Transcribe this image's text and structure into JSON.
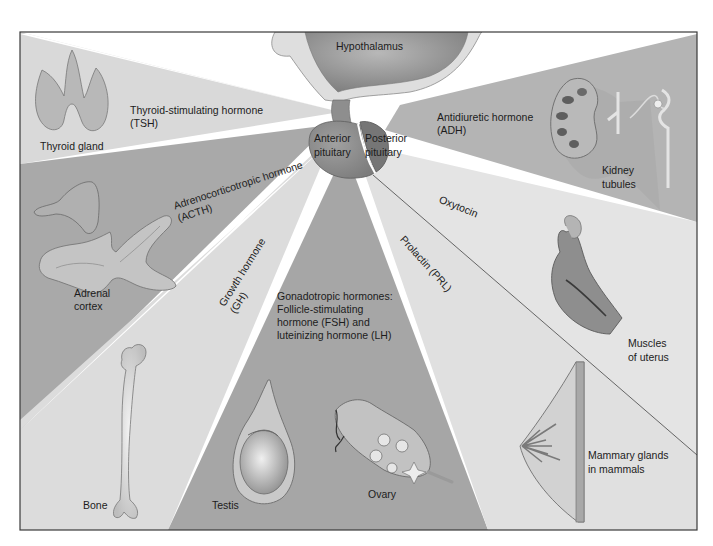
{
  "colors": {
    "background": "#ffffff",
    "frame": "#3a3a3a",
    "tsh_wedge": "#d9d9d9",
    "acth_wedge": "#a9a9a9",
    "gh_wedge": "#dddddd",
    "gonadotropic_wedge": "#a6a6a6",
    "prl_wedge": "#e0e0e0",
    "oxytocin_wedge": "#e3e3e3",
    "adh_wedge": "#b3b3b3",
    "hypothalamus": "#9a9a9a",
    "hypothalamus_rim": "#dcdcdc",
    "anterior_pituitary": "#8c8c8c",
    "posterior_pituitary": "#7a7a7a"
  },
  "brain": {
    "hypothalamus": "Hypothalamus",
    "anterior_pituitary": [
      "Anterior",
      "pituitary"
    ],
    "posterior_pituitary": [
      "Posterior",
      "pituitary"
    ]
  },
  "hormones": {
    "tsh": [
      "Thyroid-stimulating hormone",
      "(TSH)"
    ],
    "acth": [
      "Adrenocorticotropic hormone",
      "(ACTH)"
    ],
    "gh": [
      "Growth hormone",
      "(GH)"
    ],
    "gonadotropic": [
      "Gonadotropic hormones:",
      "Follicle-stimulating",
      "hormone (FSH) and",
      "luteinizing hormone (LH)"
    ],
    "prl": "Prolactin (PRL)",
    "oxytocin": "Oxytocin",
    "adh": [
      "Antidiuretic hormone",
      "(ADH)"
    ]
  },
  "targets": {
    "thyroid": "Thyroid gland",
    "adrenal": [
      "Adrenal",
      "cortex"
    ],
    "bone": "Bone",
    "testis": "Testis",
    "ovary": "Ovary",
    "mammary": [
      "Mammary glands",
      "in mammals"
    ],
    "uterus": [
      "Muscles",
      "of uterus"
    ],
    "kidney": [
      "Kidney",
      "tubules"
    ]
  }
}
